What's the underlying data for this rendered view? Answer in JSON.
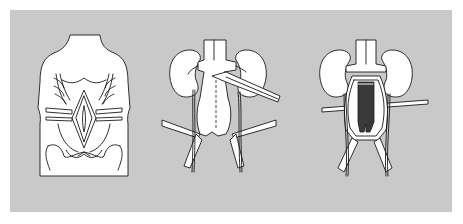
{
  "figure": {
    "type": "surgical illustration",
    "background_color": "#c9c9c9",
    "panels": [
      {
        "id": "panel-1",
        "subject": "torso-midline-incision-with-retractors"
      },
      {
        "id": "panel-2",
        "subject": "kidneys-aorta-exposure-with-retractors"
      },
      {
        "id": "panel-3",
        "subject": "aortic-graft-placement"
      }
    ]
  }
}
